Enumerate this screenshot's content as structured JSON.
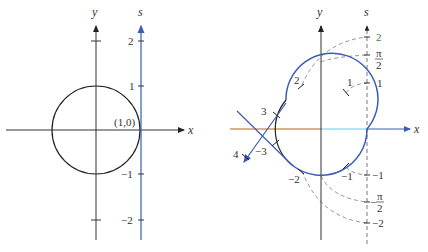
{
  "left_panel": {
    "axis_x": "x",
    "axis_y": "y",
    "axis_s": "s",
    "point_label": "(1,0)",
    "s_ticks": [
      "2",
      "1",
      "−1",
      "−2"
    ]
  },
  "right_panel": {
    "axis_x": "x",
    "axis_y": "y",
    "axis_s": "s",
    "s_labels": {
      "two": "2",
      "pi_half_num": "π",
      "pi_half_den": "2",
      "one": "1",
      "neg_one": "−1",
      "neg_pi_half_sign": "−",
      "neg_pi_half_num": "π",
      "neg_pi_half_den": "2",
      "neg_two": "−2"
    },
    "circle_labels": {
      "one": "1",
      "two": "2",
      "three": "3",
      "four": "4",
      "neg_one": "−1",
      "neg_two": "−2",
      "neg_three": "−3"
    }
  },
  "colors": {
    "axis": "#333333",
    "blue": "#3a5bb8",
    "dashed": "#777777",
    "cyan": "#5fd3e8",
    "orange": "#b5651d"
  }
}
